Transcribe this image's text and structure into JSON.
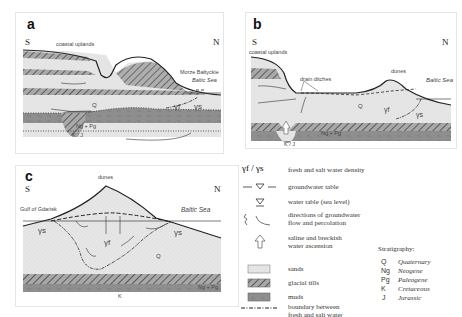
{
  "panels": {
    "a": {
      "label": "a",
      "south": "S",
      "north": "N",
      "coastal_uplands": "coastal uplands",
      "sea_name_1": "Morze Bałtyckie",
      "sea_name_2": "Baltic Sea",
      "unit_q": "Q",
      "unit_ngpg": "Ng + Pg",
      "unit_kj": "K / J",
      "gamma_f": "γf",
      "gamma_s": "γs"
    },
    "b": {
      "label": "b",
      "south": "S",
      "north": "N",
      "coastal_uplands": "coastal uplands",
      "drain_ditches": "drain ditches",
      "dunes": "dunes",
      "sea_name": "Baltic Sea",
      "unit_q": "Q",
      "unit_ngpg": "Ng + Pg",
      "unit_kj": "K / J",
      "gamma_f": "γf",
      "gamma_s": "γs"
    },
    "c": {
      "label": "c",
      "south": "S",
      "north": "N",
      "dunes": "dunes",
      "gulf": "Gulf of Gdańsk",
      "sea_name": "Baltic Sea",
      "unit_q": "Q",
      "unit_ngpg": "Ng + Pg",
      "unit_k": "K",
      "gamma_s_left": "γs",
      "gamma_f": "γf",
      "gamma_s_right": "γs"
    }
  },
  "legend": {
    "items": [
      {
        "symbol": "γf / γs",
        "text": "fresh and salt water density"
      },
      {
        "symbol": "groundwater-table-symbol",
        "text": "groundwater table"
      },
      {
        "symbol": "sea-level-symbol",
        "text": "water table (sea level)"
      },
      {
        "symbol": "flow-arrows-symbol",
        "text_1": "directions of groundwater",
        "text_2": "flow and percolation"
      },
      {
        "symbol": "up-arrow-symbol",
        "text_1": "saline and breckish",
        "text_2": "water ascension"
      },
      {
        "symbol": "sands-swatch",
        "text": "sands"
      },
      {
        "symbol": "glacial-tills-swatch",
        "text": "glacial tills"
      },
      {
        "symbol": "muds-swatch",
        "text": "muds"
      },
      {
        "symbol": "boundary-line",
        "text_1": "boundary between",
        "text_2": "fresh and salt water"
      }
    ]
  },
  "stratigraphy": {
    "title": "Stratigraphy:",
    "entries": [
      {
        "code": "Q",
        "name": "Quaternary"
      },
      {
        "code": "Ng",
        "name": "Neogene"
      },
      {
        "code": "Pg",
        "name": "Paleogene"
      },
      {
        "code": "K",
        "name": "Cretaceous"
      },
      {
        "code": "J",
        "name": "Jurassic"
      }
    ]
  },
  "colors": {
    "sand": "#e4e4e4",
    "till": "#9a9a9a",
    "mud": "#8c8c8c",
    "line": "#222222"
  }
}
